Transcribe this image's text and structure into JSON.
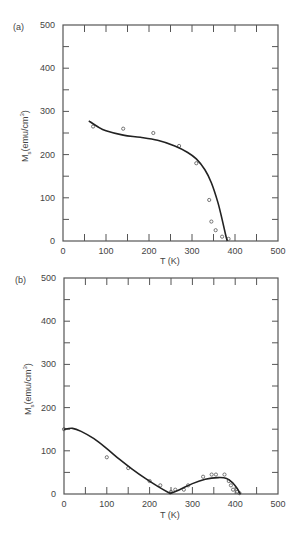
{
  "figure": {
    "panels": [
      "(a)",
      "(b)"
    ]
  },
  "chart_data": [
    {
      "type": "scatter",
      "panel_label": "(a)",
      "title": "",
      "xlabel": "T (K)",
      "ylabel": "Ms(emu/cm3)",
      "ylabel_main": "M",
      "ylabel_sub": "s",
      "ylabel_unit": "(emu/cm",
      "ylabel_sup": "3",
      "ylabel_close": ")",
      "xlim": [
        0,
        500
      ],
      "ylim": [
        0,
        500
      ],
      "xticks": [
        0,
        100,
        200,
        300,
        400,
        500
      ],
      "yticks": [
        0,
        100,
        200,
        300,
        400,
        500
      ],
      "grid": false,
      "series": [
        {
          "name": "measured",
          "style": "open-circle",
          "x": [
            70,
            140,
            210,
            270,
            310,
            340,
            345,
            355,
            370,
            385
          ],
          "y": [
            265,
            260,
            250,
            220,
            180,
            95,
            45,
            25,
            10,
            5
          ]
        },
        {
          "name": "fit",
          "style": "line",
          "x": [
            60,
            80,
            100,
            140,
            180,
            220,
            260,
            290,
            310,
            330,
            345,
            360,
            370,
            378,
            382
          ],
          "y": [
            278,
            265,
            255,
            245,
            240,
            233,
            220,
            205,
            190,
            165,
            135,
            90,
            50,
            15,
            0
          ]
        }
      ]
    },
    {
      "type": "scatter",
      "panel_label": "(b)",
      "title": "",
      "xlabel": "T (K)",
      "ylabel": "Ms(emu/cm3)",
      "ylabel_main": "M",
      "ylabel_sub": "s",
      "ylabel_unit": "(emu/cm",
      "ylabel_sup": "3",
      "ylabel_close": ")",
      "xlim": [
        0,
        500
      ],
      "ylim": [
        0,
        500
      ],
      "xticks": [
        0,
        100,
        200,
        300,
        400,
        500
      ],
      "yticks": [
        0,
        100,
        200,
        300,
        400,
        500
      ],
      "grid": false,
      "series": [
        {
          "name": "measured",
          "style": "open-circle",
          "x": [
            0,
            100,
            150,
            200,
            225,
            250,
            260,
            280,
            290,
            325,
            345,
            355,
            375,
            385,
            390,
            395,
            405,
            410
          ],
          "y": [
            150,
            85,
            60,
            30,
            20,
            5,
            10,
            10,
            20,
            40,
            45,
            45,
            45,
            30,
            20,
            10,
            5,
            2
          ]
        },
        {
          "name": "fit",
          "style": "line",
          "x": [
            0,
            20,
            40,
            70,
            100,
            130,
            160,
            190,
            220,
            245,
            250,
            270,
            300,
            330,
            360,
            380,
            395,
            405,
            412
          ],
          "y": [
            150,
            152,
            145,
            128,
            105,
            80,
            57,
            36,
            17,
            3,
            2,
            10,
            24,
            34,
            38,
            36,
            25,
            12,
            0
          ]
        }
      ]
    }
  ]
}
